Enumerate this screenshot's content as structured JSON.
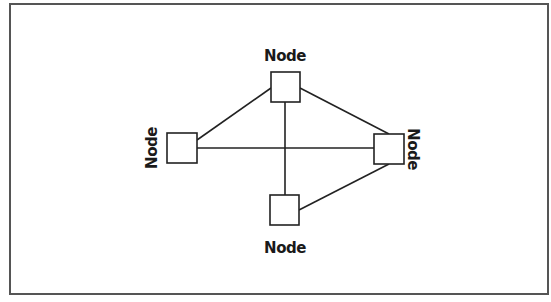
{
  "diagram": {
    "type": "network-topology",
    "frame": {
      "x": 10,
      "y": 4,
      "width": 538,
      "height": 290,
      "stroke": "#555555"
    },
    "colors": {
      "line": "#222222",
      "node_fill": "#ffffff",
      "node_stroke": "#222222",
      "text": "#1a1a1a"
    },
    "nodes": [
      {
        "id": "top",
        "label": "Node",
        "x": 271,
        "y": 72,
        "w": 29,
        "h": 30,
        "label_x": 285,
        "label_y": 61,
        "rotate": 0
      },
      {
        "id": "left",
        "label": "Node",
        "x": 167,
        "y": 133,
        "w": 30,
        "h": 30,
        "label_x": 152,
        "label_y": 148,
        "rotate": -90
      },
      {
        "id": "right",
        "label": "Node",
        "x": 374,
        "y": 134,
        "w": 30,
        "h": 30,
        "label_x": 413,
        "label_y": 149,
        "rotate": 90
      },
      {
        "id": "bottom",
        "label": "Node",
        "x": 270,
        "y": 195,
        "w": 29,
        "h": 30,
        "label_x": 285,
        "label_y": 253,
        "rotate": 0
      }
    ],
    "edges": [
      {
        "from": "top",
        "to": "left",
        "x1": 271,
        "y1": 88,
        "x2": 197,
        "y2": 140
      },
      {
        "from": "top",
        "to": "right",
        "x1": 300,
        "y1": 88,
        "x2": 389,
        "y2": 134
      },
      {
        "from": "top",
        "to": "bottom",
        "x1": 285,
        "y1": 102,
        "x2": 285,
        "y2": 195
      },
      {
        "from": "left",
        "to": "right",
        "x1": 197,
        "y1": 148,
        "x2": 374,
        "y2": 148
      },
      {
        "from": "right",
        "to": "bottom",
        "x1": 389,
        "y1": 164,
        "x2": 299,
        "y2": 210
      }
    ]
  }
}
